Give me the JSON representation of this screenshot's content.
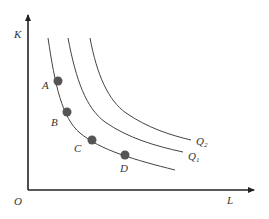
{
  "diagram": {
    "type": "isoquant-map",
    "axes": {
      "y_label": "K",
      "x_label": "L",
      "origin_label": "O"
    },
    "curves": [
      {
        "id": "Q0",
        "label": ""
      },
      {
        "id": "Q1",
        "label": "Q",
        "subscript": "1"
      },
      {
        "id": "Q2",
        "label": "Q",
        "subscript": "2"
      }
    ],
    "points": [
      {
        "label": "A"
      },
      {
        "label": "B"
      },
      {
        "label": "C"
      },
      {
        "label": "D"
      }
    ],
    "colors": {
      "axis": "#222222",
      "curve": "#444444",
      "point": "#555555",
      "text": "#333333"
    }
  }
}
